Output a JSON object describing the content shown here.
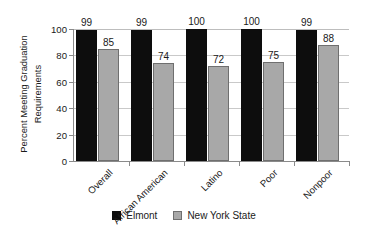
{
  "chart_data": {
    "type": "bar",
    "title": "",
    "xlabel": "",
    "ylabel": "Percent Meeting Graduation Requirements",
    "ylabel_line1": "Percent Meeting Graduation",
    "ylabel_line2": "Requirements",
    "categories": [
      "Overall",
      "African American",
      "Latino",
      "Poor",
      "Nonpoor"
    ],
    "series": [
      {
        "name": "Elmont",
        "color": "#0d0d0d",
        "values": [
          99,
          99,
          100,
          100,
          99
        ]
      },
      {
        "name": "New York State",
        "color": "#a8a8a8",
        "values": [
          85,
          74,
          72,
          75,
          88
        ]
      }
    ],
    "ylim": [
      0,
      100
    ],
    "yticks": [
      0,
      20,
      40,
      60,
      80,
      100
    ],
    "ytick_labels": [
      "0",
      "20",
      "40",
      "60",
      "80",
      "100"
    ],
    "grid": true,
    "grid_axis": "y",
    "legend_position": "bottom-center",
    "data_labels": true
  },
  "legend": {
    "items": [
      {
        "label": "Elmont",
        "swatch": "black-square-swatch"
      },
      {
        "label": "New York State",
        "swatch": "gray-square-swatch"
      }
    ]
  }
}
